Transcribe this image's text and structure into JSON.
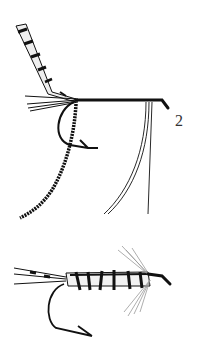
{
  "figures": [
    {
      "id": "fly-2",
      "label": "2",
      "description": "fly with barred feather wing, tail fibres, hook, long hackle fibres and wrapped body strand"
    },
    {
      "id": "fly-4",
      "label": "4",
      "description": "completed wet fly with barred tail, ribbed body, hackle and hook"
    }
  ],
  "colors": {
    "ink": "#111111",
    "background": "#ffffff",
    "label": "#333333"
  }
}
